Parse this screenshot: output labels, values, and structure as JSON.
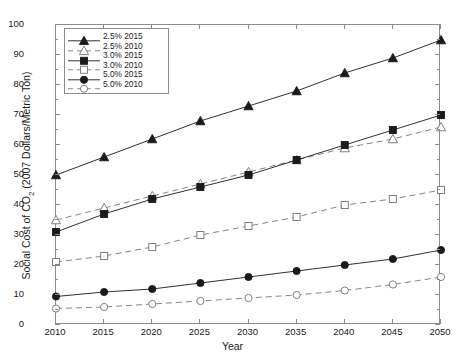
{
  "chart_data": {
    "type": "line",
    "title": "",
    "xlabel": "Year",
    "ylabel": "Social Cost of CO2 (2007 Dollars/Metric Ton)",
    "ylabel_main": "Social Cost of CO",
    "ylabel_sub": "2",
    "ylabel_tail": " (2007 Dollars/Metric Ton)",
    "x": [
      2010,
      2015,
      2020,
      2025,
      2030,
      2035,
      2040,
      2045,
      2050
    ],
    "categories": [
      "2010",
      "2015",
      "2020",
      "2025",
      "2030",
      "2035",
      "2040",
      "2045",
      "2050"
    ],
    "xlim": [
      2010,
      2050
    ],
    "ylim": [
      0,
      100
    ],
    "yticks": [
      0,
      10,
      20,
      30,
      40,
      50,
      60,
      70,
      80,
      90,
      100
    ],
    "xticks": [
      2010,
      2015,
      2020,
      2025,
      2030,
      2035,
      2040,
      2045,
      2050
    ],
    "grid": false,
    "legend_position": "upper-left",
    "series": [
      {
        "name": "2.5% 2015",
        "marker": "filled-triangle",
        "line": "solid",
        "color": "#1a1a1a",
        "values": [
          50,
          56,
          62,
          68,
          73,
          78,
          84,
          89,
          95
        ]
      },
      {
        "name": "2.5% 2010",
        "marker": "open-triangle",
        "line": "dashed",
        "color": "#777777",
        "values": [
          35,
          39,
          43,
          47,
          51,
          55,
          59,
          62,
          66
        ]
      },
      {
        "name": "3.0% 2015",
        "marker": "filled-square",
        "line": "solid",
        "color": "#1a1a1a",
        "values": [
          31,
          37,
          42,
          46,
          50,
          55,
          60,
          65,
          70
        ]
      },
      {
        "name": "3.0% 2010",
        "marker": "open-square",
        "line": "dashed",
        "color": "#777777",
        "values": [
          21,
          23,
          26,
          30,
          33,
          36,
          40,
          42,
          45
        ]
      },
      {
        "name": "5.0% 2015",
        "marker": "filled-circle",
        "line": "solid",
        "color": "#1a1a1a",
        "values": [
          9.5,
          11,
          12,
          14,
          16,
          18,
          20,
          22,
          25
        ]
      },
      {
        "name": "5.0% 2010",
        "marker": "open-circle",
        "line": "dashed",
        "color": "#777777",
        "values": [
          5.5,
          6,
          7,
          8,
          9,
          10,
          11.5,
          13.5,
          16
        ]
      }
    ]
  }
}
